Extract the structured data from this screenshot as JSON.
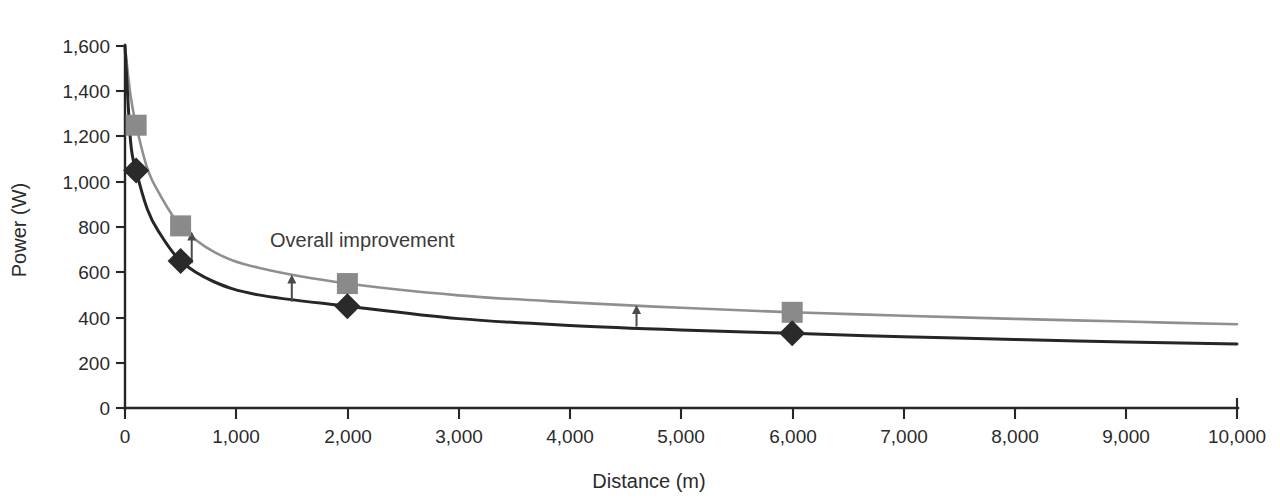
{
  "chart_data": {
    "type": "line",
    "title": "",
    "xlabel": "Distance (m)",
    "ylabel": "Power (W)",
    "xlim": [
      0,
      10000
    ],
    "ylim": [
      0,
      1600
    ],
    "grid": false,
    "legend": "none",
    "xticks": [
      0,
      1000,
      2000,
      3000,
      4000,
      5000,
      6000,
      7000,
      8000,
      9000,
      10000
    ],
    "xtick_labels": [
      "0",
      "1,000",
      "2,000",
      "3,000",
      "4,000",
      "5,000",
      "6,000",
      "7,000",
      "8,000",
      "9,000",
      "10,000"
    ],
    "yticks": [
      0,
      200,
      400,
      600,
      800,
      1000,
      1200,
      1400,
      1600
    ],
    "ytick_labels": [
      "0",
      "200",
      "400",
      "600",
      "800",
      "1,000",
      "1,200",
      "1,400",
      "1,600"
    ],
    "series": [
      {
        "name": "Upper curve",
        "marker": "square",
        "color": "#8a8a8a",
        "line_color": "#8f8f8f",
        "x": [
          0,
          50,
          100,
          200,
          300,
          500,
          800,
          1200,
          2000,
          3000,
          4000,
          5000,
          6000,
          7000,
          8000,
          9000,
          10000
        ],
        "y": [
          1600,
          1380,
          1250,
          1060,
          955,
          805,
          690,
          620,
          550,
          498,
          467,
          443,
          423,
          408,
          394,
          382,
          370
        ],
        "markers": [
          {
            "x": 100,
            "y": 1250
          },
          {
            "x": 500,
            "y": 805
          },
          {
            "x": 2000,
            "y": 550
          },
          {
            "x": 6000,
            "y": 423
          }
        ]
      },
      {
        "name": "Lower curve",
        "marker": "diamond",
        "color": "#2a2a2a",
        "line_color": "#262626",
        "x": [
          0,
          50,
          100,
          200,
          300,
          500,
          800,
          1200,
          2000,
          3000,
          4000,
          5000,
          6000,
          7000,
          8000,
          9000,
          10000
        ],
        "y": [
          1600,
          1180,
          1050,
          880,
          782,
          650,
          558,
          500,
          450,
          395,
          365,
          345,
          330,
          315,
          303,
          292,
          283
        ]
      },
      {
        "name": "Lower curve markers",
        "marker": "diamond",
        "color": "#2a2a2a",
        "markers": [
          {
            "x": 100,
            "y": 1050
          },
          {
            "x": 500,
            "y": 650
          },
          {
            "x": 2000,
            "y": 450
          },
          {
            "x": 6000,
            "y": 330
          }
        ]
      }
    ],
    "annotations": [
      {
        "text": "Overall improvement",
        "x": 1400,
        "y": 760,
        "type": "text-label"
      },
      {
        "type": "arrow",
        "x": 600,
        "y_from": 640,
        "y_to": 780
      },
      {
        "type": "arrow",
        "x": 1500,
        "y_from": 470,
        "y_to": 590
      },
      {
        "type": "arrow",
        "x": 4600,
        "y_from": 360,
        "y_to": 455
      }
    ]
  },
  "colors": {
    "upper_series": "#8f8f8f",
    "lower_series": "#262626",
    "axis": "#262626",
    "text": "#2b2b2b",
    "annotation": "#4a4a4a",
    "background": "#ffffff"
  }
}
